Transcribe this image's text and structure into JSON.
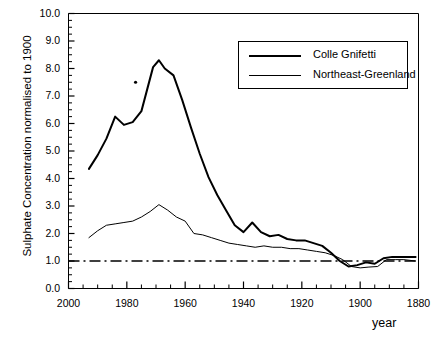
{
  "chart_data": {
    "type": "line",
    "title": "",
    "xlabel": "year",
    "ylabel": "Sulphate Concentration normalised to 1900",
    "xlim": [
      2000,
      1880
    ],
    "ylim": [
      0.0,
      10.0
    ],
    "x_reversed": true,
    "grid": false,
    "legend_position": "top-right",
    "xticks": [
      2000,
      1980,
      1960,
      1940,
      1920,
      1900,
      1880
    ],
    "xtick_labels": [
      "2000",
      "1980",
      "1960",
      "1940",
      "1920",
      "1900",
      "1880"
    ],
    "x_minor_tick_interval": 5,
    "yticks": [
      0.0,
      1.0,
      2.0,
      3.0,
      4.0,
      5.0,
      6.0,
      7.0,
      8.0,
      9.0,
      10.0
    ],
    "ytick_labels": [
      "0.0",
      "1.0",
      "2.0",
      "3.0",
      "4.0",
      "5.0",
      "6.0",
      "7.0",
      "8.0",
      "9.0",
      "10.0"
    ],
    "y_minor_tick_interval": 0.25,
    "reference_line": {
      "name": "baseline-1900",
      "y": 1.0,
      "style": "dash-dot",
      "label": ""
    },
    "annotations": [
      {
        "name": "isolated-point",
        "x": 1977,
        "y": 7.5,
        "marker": "dot"
      }
    ],
    "series": [
      {
        "name": "Colle Gnifetti",
        "color": "#000000",
        "line_width": 2.0,
        "x": [
          1993,
          1990,
          1987,
          1984,
          1981,
          1978,
          1975,
          1973,
          1971,
          1969,
          1967,
          1964,
          1961,
          1958,
          1955,
          1952,
          1949,
          1946,
          1943,
          1940,
          1937,
          1934,
          1931,
          1928,
          1925,
          1922,
          1919,
          1916,
          1913,
          1910,
          1907,
          1904,
          1901,
          1898,
          1895,
          1892,
          1889,
          1886,
          1883,
          1881
        ],
        "y": [
          4.35,
          4.85,
          5.45,
          6.25,
          5.95,
          6.05,
          6.45,
          7.25,
          8.05,
          8.3,
          8.0,
          7.75,
          6.85,
          5.85,
          4.9,
          4.05,
          3.4,
          2.85,
          2.3,
          2.05,
          2.4,
          2.05,
          1.9,
          1.95,
          1.8,
          1.75,
          1.75,
          1.65,
          1.55,
          1.3,
          1.0,
          0.8,
          0.85,
          0.95,
          0.9,
          1.1,
          1.15,
          1.15,
          1.15,
          1.15
        ]
      },
      {
        "name": "Northeast-Greenland",
        "color": "#000000",
        "line_width": 1.0,
        "x": [
          1993,
          1990,
          1987,
          1984,
          1981,
          1978,
          1975,
          1972,
          1969,
          1966,
          1963,
          1960,
          1957,
          1954,
          1951,
          1948,
          1945,
          1942,
          1939,
          1936,
          1933,
          1930,
          1927,
          1924,
          1921,
          1918,
          1915,
          1912,
          1909,
          1906,
          1903,
          1900,
          1897,
          1894,
          1891,
          1888,
          1885,
          1881
        ],
        "y": [
          1.85,
          2.1,
          2.3,
          2.35,
          2.4,
          2.45,
          2.6,
          2.8,
          3.05,
          2.85,
          2.6,
          2.45,
          2.0,
          1.95,
          1.85,
          1.75,
          1.65,
          1.6,
          1.55,
          1.5,
          1.55,
          1.5,
          1.5,
          1.45,
          1.45,
          1.4,
          1.35,
          1.3,
          1.2,
          1.05,
          0.8,
          0.75,
          0.78,
          0.8,
          1.05,
          1.05,
          1.05,
          1.0
        ]
      }
    ]
  },
  "axes": {
    "x_title": "year",
    "y_title": "Sulphate Concentration normalised to 1900"
  },
  "legend": {
    "entries": [
      {
        "label": "Colle Gnifetti",
        "style": "thick"
      },
      {
        "label": "Northeast-Greenland",
        "style": "thin"
      }
    ]
  }
}
